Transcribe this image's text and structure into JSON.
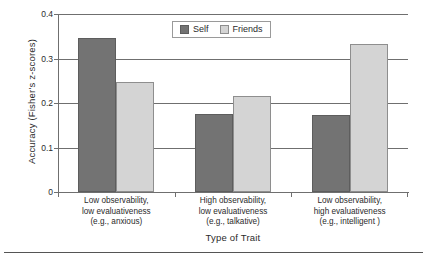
{
  "chart_data": {
    "type": "bar",
    "title": "",
    "xlabel": "Type of Trait",
    "ylabel": "Accuracy (Fisher's z-scores)",
    "ylim": [
      0,
      0.4
    ],
    "yticks": [
      "0",
      "0.1",
      "0.2",
      "0.3",
      "0.4"
    ],
    "ytick_values": [
      0,
      0.1,
      0.2,
      0.3,
      0.4
    ],
    "grid": true,
    "legend_position": "top-center",
    "categories": [
      "Low observability, low evaluativeness (e.g., anxious)",
      "High observability, low evaluativeness (e.g., talkative)",
      "Low observability, high evaluativeness (e.g., intelligent )"
    ],
    "category_lines": [
      [
        "Low observability,",
        "low evaluativeness",
        "(e.g., anxious)"
      ],
      [
        "High observability,",
        "low evaluativeness",
        "(e.g., talkative)"
      ],
      [
        "Low observability,",
        "high evaluativeness",
        "(e.g., intelligent )"
      ]
    ],
    "series": [
      {
        "name": "Self",
        "color": "#737373",
        "values": [
          0.345,
          0.175,
          0.173
        ]
      },
      {
        "name": "Friends",
        "color": "#d4d4d4",
        "values": [
          0.247,
          0.216,
          0.333
        ]
      }
    ]
  },
  "legend": {
    "entries": [
      {
        "label": "Self"
      },
      {
        "label": "Friends"
      }
    ]
  },
  "axes": {
    "y_title": "Accuracy (Fisher's z-scores)",
    "x_title": "Type of Trait",
    "y_tick_0": "0",
    "y_tick_1": "0.1",
    "y_tick_2": "0.2",
    "y_tick_3": "0.3",
    "y_tick_4": "0.4"
  },
  "colors": {
    "self_bar": "#737373",
    "friends_bar": "#d4d4d4",
    "axis": "#6f6f6f",
    "text": "#2b2b2b",
    "background": "#ffffff"
  }
}
